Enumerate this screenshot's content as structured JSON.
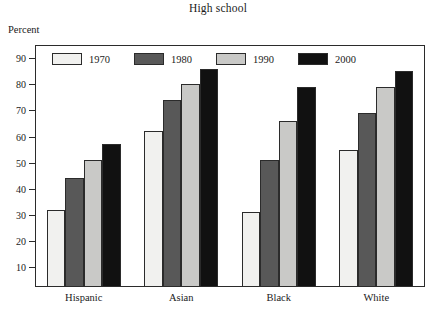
{
  "chart_data": {
    "type": "bar",
    "title": "High school",
    "xlabel": "",
    "ylabel": "Percent",
    "ylim": [
      0,
      95
    ],
    "yticks": [
      10,
      20,
      30,
      40,
      50,
      60,
      70,
      80,
      90
    ],
    "grid": false,
    "legend_position": "top-inside-left",
    "categories": [
      "Hispanic",
      "Asian",
      "Black",
      "White"
    ],
    "series": [
      {
        "name": "1970",
        "color": "#f1f1ef",
        "values": [
          32,
          62,
          31,
          55
        ]
      },
      {
        "name": "1980",
        "color": "#585858",
        "values": [
          44,
          74,
          51,
          69
        ]
      },
      {
        "name": "1990",
        "color": "#c9c9c7",
        "values": [
          51,
          80,
          66,
          79
        ]
      },
      {
        "name": "2000",
        "color": "#111111",
        "values": [
          57,
          86,
          79,
          85
        ]
      }
    ]
  },
  "axis": {
    "y_caption": "Percent"
  }
}
